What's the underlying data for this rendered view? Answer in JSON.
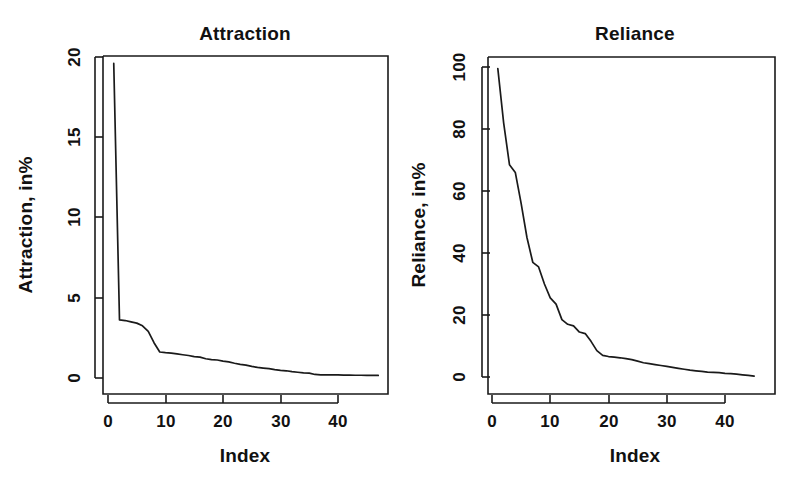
{
  "figure": {
    "background": "#ffffff",
    "line_color": "#1a1a1a",
    "text_color": "#111111",
    "panel_count": 2
  },
  "chart_data": [
    {
      "type": "line",
      "panel": "left",
      "title": "Attraction",
      "xlabel": "Index",
      "ylabel": "Attraction, in%",
      "xlim": [
        0,
        48
      ],
      "ylim": [
        0,
        20
      ],
      "xticks": [
        0,
        10,
        20,
        30,
        40
      ],
      "yticks": [
        0,
        5,
        10,
        15,
        20
      ],
      "xticklabels": [
        "0",
        "10",
        "20",
        "30",
        "40"
      ],
      "yticklabels": [
        "0",
        "5",
        "10",
        "15",
        "20"
      ],
      "grid": false,
      "legend": false,
      "box": true,
      "series": [
        {
          "name": "Attraction",
          "x": [
            1,
            2,
            3,
            4,
            5,
            6,
            7,
            8,
            9,
            10,
            11,
            12,
            13,
            14,
            15,
            16,
            17,
            18,
            19,
            20,
            21,
            22,
            23,
            24,
            25,
            26,
            27,
            28,
            29,
            30,
            31,
            32,
            33,
            34,
            35,
            36,
            37,
            38,
            39,
            40,
            41,
            42,
            43,
            44,
            45,
            46,
            47
          ],
          "values": [
            19.6,
            3.62,
            3.58,
            3.5,
            3.42,
            3.25,
            2.9,
            2.2,
            1.62,
            1.58,
            1.55,
            1.5,
            1.45,
            1.4,
            1.33,
            1.3,
            1.2,
            1.15,
            1.12,
            1.05,
            1.0,
            0.92,
            0.85,
            0.8,
            0.72,
            0.66,
            0.62,
            0.58,
            0.52,
            0.48,
            0.45,
            0.4,
            0.36,
            0.32,
            0.3,
            0.22,
            0.2,
            0.2,
            0.19,
            0.19,
            0.18,
            0.18,
            0.17,
            0.17,
            0.16,
            0.16,
            0.16
          ]
        }
      ]
    },
    {
      "type": "line",
      "panel": "right",
      "title": "Reliance",
      "xlabel": "Index",
      "ylabel": "Reliance, in%",
      "xlim": [
        0,
        46
      ],
      "ylim": [
        0,
        100
      ],
      "xticks": [
        0,
        10,
        20,
        30,
        40
      ],
      "yticks": [
        0,
        20,
        40,
        60,
        80,
        100
      ],
      "xticklabels": [
        "0",
        "10",
        "20",
        "30",
        "40"
      ],
      "yticklabels": [
        "0",
        "20",
        "40",
        "60",
        "80",
        "100"
      ],
      "grid": false,
      "legend": false,
      "box": true,
      "series": [
        {
          "name": "Reliance",
          "x": [
            1,
            2,
            3,
            4,
            5,
            6,
            7,
            8,
            9,
            10,
            11,
            12,
            13,
            14,
            15,
            16,
            17,
            18,
            19,
            20,
            21,
            22,
            23,
            24,
            25,
            26,
            27,
            28,
            29,
            30,
            31,
            32,
            33,
            34,
            35,
            36,
            37,
            38,
            39,
            40,
            41,
            42,
            43,
            44,
            45
          ],
          "values": [
            99.5,
            82.0,
            68.5,
            66.0,
            56.0,
            45.0,
            37.0,
            35.5,
            30.0,
            25.5,
            23.5,
            18.5,
            17.0,
            16.5,
            14.5,
            14.0,
            11.5,
            8.5,
            7.0,
            6.6,
            6.4,
            6.2,
            5.9,
            5.6,
            5.1,
            4.6,
            4.3,
            4.0,
            3.7,
            3.4,
            3.1,
            2.8,
            2.5,
            2.2,
            2.0,
            1.8,
            1.6,
            1.5,
            1.4,
            1.2,
            1.1,
            0.9,
            0.7,
            0.5,
            0.3
          ]
        }
      ]
    }
  ]
}
